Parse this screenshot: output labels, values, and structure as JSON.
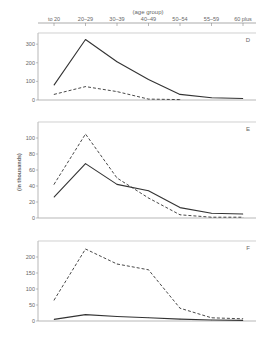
{
  "chart_data": {
    "type": "line",
    "xlabel": "(age group)",
    "ylabel": "(in thousands)",
    "categories": [
      "to 20",
      "20–29",
      "30–39",
      "40–49",
      "50–54",
      "55–59",
      "60 plus"
    ],
    "panels": [
      {
        "label": "D",
        "ylim": [
          0,
          360
        ],
        "yticks": [
          0,
          100,
          200,
          300
        ],
        "series": [
          {
            "name": "solid",
            "style": "solid",
            "values": [
              80,
              325,
              205,
              110,
              30,
              12,
              8
            ]
          },
          {
            "name": "dashed",
            "style": "dashed",
            "values": [
              30,
              72,
              45,
              5,
              2,
              null,
              null
            ]
          }
        ]
      },
      {
        "label": "E",
        "ylim": [
          0,
          120
        ],
        "yticks": [
          0,
          20,
          40,
          60,
          80,
          100
        ],
        "series": [
          {
            "name": "solid",
            "style": "solid",
            "values": [
              26,
              68,
              42,
              34,
              13,
              6,
              5
            ]
          },
          {
            "name": "dashed",
            "style": "dashed",
            "values": [
              42,
              105,
              50,
              25,
              4,
              1,
              1
            ]
          }
        ]
      },
      {
        "label": "F",
        "ylim": [
          0,
          250
        ],
        "yticks": [
          0,
          50,
          100,
          150,
          200
        ],
        "series": [
          {
            "name": "solid",
            "style": "solid",
            "values": [
              5,
              20,
              14,
              10,
              6,
              3,
              2
            ]
          },
          {
            "name": "dashed",
            "style": "dashed",
            "values": [
              65,
              225,
              178,
              160,
              40,
              10,
              7
            ]
          }
        ]
      }
    ],
    "grid": false,
    "legend": "none"
  }
}
